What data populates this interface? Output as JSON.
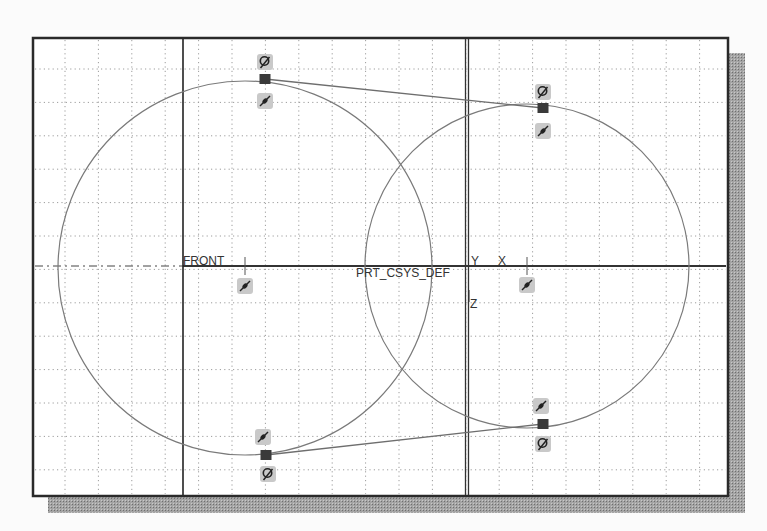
{
  "sketch": {
    "frame": {
      "x": 33,
      "y": 38,
      "width": 695,
      "height": 458
    },
    "shadow_color": "#9a9a9a",
    "background": "#ffffff",
    "grid": {
      "spacing": 33.4,
      "origin_x": 65,
      "origin_y": 69,
      "color": "#9c9c9c"
    },
    "labels": {
      "front": "FRONT",
      "csys": "PRT_CSYS_DEF",
      "y_axis": "Y",
      "x_axis": "X",
      "z_axis": "Z"
    },
    "reference_lines": {
      "horizontal_axis_y": 266,
      "front_plane_x": 183,
      "csys_vertical_x": 467
    },
    "circles": [
      {
        "name": "left-circle",
        "cx": 245,
        "cy": 268,
        "r": 187
      },
      {
        "name": "right-circle",
        "cx": 527,
        "cy": 266,
        "r": 162
      }
    ],
    "tangent_lines": [
      {
        "name": "top-tangent",
        "x1": 265,
        "y1": 79,
        "x2": 543,
        "y2": 108
      },
      {
        "name": "bottom-tangent",
        "x1": 266,
        "y1": 455,
        "x2": 543,
        "y2": 424
      }
    ],
    "center_marks": [
      {
        "x": 245,
        "y": 266
      },
      {
        "x": 527,
        "y": 266
      }
    ],
    "constraint_icons": [
      {
        "type": "tangent",
        "x": 265,
        "y": 62
      },
      {
        "type": "point-on-entity",
        "x": 265,
        "y": 101
      },
      {
        "type": "tangent",
        "x": 543,
        "y": 92
      },
      {
        "type": "point-on-entity",
        "x": 543,
        "y": 131
      },
      {
        "type": "point-on-entity",
        "x": 245,
        "y": 286
      },
      {
        "type": "point-on-entity",
        "x": 527,
        "y": 285
      },
      {
        "type": "point-on-entity",
        "x": 263,
        "y": 437
      },
      {
        "type": "tangent",
        "x": 268,
        "y": 474
      },
      {
        "type": "point-on-entity",
        "x": 541,
        "y": 406
      },
      {
        "type": "tangent",
        "x": 543,
        "y": 444
      }
    ],
    "tangent_points": [
      {
        "x": 265,
        "y": 79
      },
      {
        "x": 543,
        "y": 108
      },
      {
        "x": 266,
        "y": 455
      },
      {
        "x": 543,
        "y": 424
      }
    ]
  }
}
